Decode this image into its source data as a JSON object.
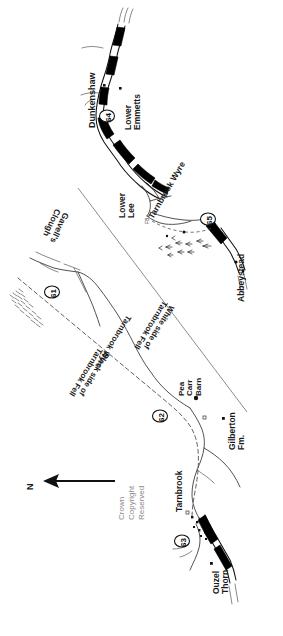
{
  "map": {
    "title": "Tarnbrook and Abbeystead sketch map",
    "orientation_note": "labels rotated 90 degrees; map drawn sideways",
    "copyright": {
      "line1": "Crown",
      "line2": "Copyright",
      "line3": "Reserved"
    },
    "north_arrow": {
      "label": "N",
      "direction": "left"
    },
    "colors": {
      "ink": "#111111",
      "river_fill": "#000000",
      "paper": "#ffffff",
      "faint": "#8a8a8a"
    },
    "place_labels": [
      {
        "name": "dunkenshaw",
        "text": "Dunkenshaw"
      },
      {
        "name": "lower-emmetts",
        "text": "Lower\nEmmetts"
      },
      {
        "name": "lower-lee",
        "text": "Lower\nLee"
      },
      {
        "name": "tarnbrook-wyre-north",
        "text": "Tarnbrook Wyre"
      },
      {
        "name": "footbridge",
        "text": "FB"
      },
      {
        "name": "abbeystead",
        "text": "Abbeystead"
      },
      {
        "name": "gavells-clough",
        "text": "Gavell's\nClough"
      },
      {
        "name": "tarnbrook-wyre-south",
        "text": "Tarnbrook Wyre"
      },
      {
        "name": "white-side-of-tarnbrook-fell",
        "text": "White side of\nTarnbrook Fell"
      },
      {
        "name": "black-side-of-tarnbrook-fell",
        "text": "Black side of\nTarnbrook Fell"
      },
      {
        "name": "pea-carr-barn",
        "text": "Pea\nCarr\nBarn"
      },
      {
        "name": "gilberton-fm",
        "text": "Gilberton\nFm."
      },
      {
        "name": "tarnbrook",
        "text": "Tarnbrook"
      },
      {
        "name": "ouzel-thorn",
        "text": "Ouzel\nThorn"
      }
    ],
    "site_markers": [
      {
        "name": "marker-61",
        "label": "61"
      },
      {
        "name": "marker-62",
        "label": "62"
      },
      {
        "name": "marker-63",
        "label": "63"
      },
      {
        "name": "marker-64",
        "label": "64"
      },
      {
        "name": "marker-65",
        "label": "65"
      }
    ]
  }
}
